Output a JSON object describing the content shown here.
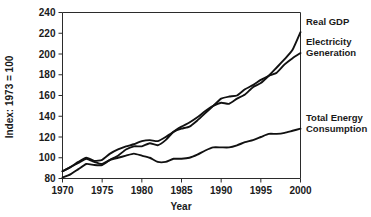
{
  "chart_data": {
    "type": "line",
    "title": "",
    "xlabel": "Year",
    "ylabel": "Index: 1973 = 100",
    "xlim": [
      1970,
      2000
    ],
    "ylim": [
      80,
      240
    ],
    "xticks": [
      1970,
      1975,
      1980,
      1985,
      1990,
      1995,
      2000
    ],
    "yticks": [
      80,
      100,
      120,
      140,
      160,
      180,
      200,
      220,
      240
    ],
    "grid": false,
    "legend_position": "right-inline-labels",
    "x": [
      1970,
      1971,
      1972,
      1973,
      1974,
      1975,
      1976,
      1977,
      1978,
      1979,
      1980,
      1981,
      1982,
      1983,
      1984,
      1985,
      1986,
      1987,
      1988,
      1989,
      1990,
      1991,
      1992,
      1993,
      1994,
      1995,
      1996,
      1997,
      1998,
      1999,
      2000
    ],
    "series": [
      {
        "name": "Real GDP",
        "label": "Real GDP",
        "color": "#111111",
        "values": [
          81,
          84,
          89,
          94,
          93,
          93,
          98,
          102,
          108,
          111,
          111,
          114,
          112,
          117,
          125,
          130,
          134,
          139,
          145,
          150,
          153,
          152,
          157,
          161,
          168,
          172,
          179,
          187,
          195,
          204,
          221
        ]
      },
      {
        "name": "Electricity Generation",
        "label": "Electricity Generation",
        "color": "#111111",
        "values": [
          87,
          91,
          96,
          100,
          97,
          98,
          104,
          108,
          111,
          113,
          116,
          117,
          116,
          120,
          125,
          128,
          130,
          136,
          143,
          150,
          157,
          159,
          160,
          166,
          170,
          175,
          179,
          182,
          190,
          196,
          201
        ]
      },
      {
        "name": "Total Energy Consumption",
        "label": "Total Energy Consumption",
        "color": "#111111",
        "values": [
          87,
          91,
          95,
          99,
          96,
          94,
          98,
          100,
          102,
          104,
          102,
          100,
          96,
          96,
          99,
          99,
          100,
          103,
          107,
          110,
          110,
          110,
          112,
          115,
          117,
          120,
          123,
          123,
          124,
          126,
          128
        ]
      }
    ],
    "annotations": [
      {
        "text": "Real GDP",
        "anchor_year": 2000,
        "anchor_value": 221
      },
      {
        "text": "Electricity Generation",
        "anchor_year": 2000,
        "anchor_value": 201
      },
      {
        "text": "Total Energy Consumption",
        "anchor_year": 2000,
        "anchor_value": 128
      }
    ]
  },
  "labels": {
    "series_1_line_1": "Real GDP",
    "series_2_line_1": "Electricity",
    "series_2_line_2": "Generation",
    "series_3_line_1": "Total Energy",
    "series_3_line_2": "Consumption"
  }
}
